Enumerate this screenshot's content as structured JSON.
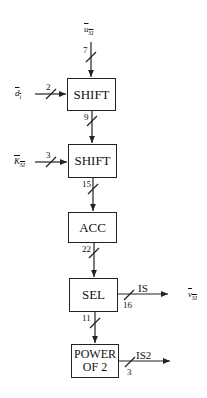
{
  "diagram": {
    "type": "block-diagram",
    "blocks": [
      {
        "id": "shift1",
        "label": "SHIFT"
      },
      {
        "id": "shift2",
        "label": "SHIFT"
      },
      {
        "id": "acc",
        "label": "ACC"
      },
      {
        "id": "sel",
        "label": "SEL"
      },
      {
        "id": "pow2",
        "label_line1": "POWER",
        "label_line2": "OF 2"
      }
    ],
    "inputs": {
      "u": {
        "base": "u",
        "sub": "SI",
        "width": "7"
      },
      "d": {
        "base": "d",
        "sub": "i",
        "width": "2"
      },
      "k": {
        "base": "K",
        "sub": "SI",
        "width": "3"
      }
    },
    "buses": {
      "shift1_to_shift2": "9",
      "shift2_to_acc": "15",
      "acc_to_sel": "22",
      "sel_to_pow2": "11"
    },
    "outputs": {
      "is": {
        "name": "IS",
        "width": "16",
        "signal_base": "v",
        "signal_sub": "SI"
      },
      "is2": {
        "name": "IS2",
        "width": "3"
      }
    }
  }
}
